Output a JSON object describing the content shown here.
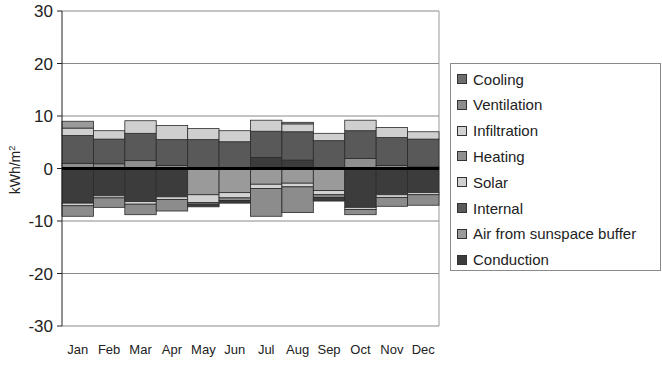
{
  "chart_data": {
    "type": "bar",
    "stacked": true,
    "diverging": true,
    "title": "",
    "xlabel": "",
    "ylabel": "kWh/m²",
    "ylim": [
      -30,
      30
    ],
    "yticks": [
      30,
      20,
      10,
      0,
      -10,
      -20,
      -30
    ],
    "grid": true,
    "legend_position": "right",
    "categories": [
      "Jan",
      "Feb",
      "Mar",
      "Apr",
      "May",
      "Jun",
      "Jul",
      "Aug",
      "Sep",
      "Oct",
      "Nov",
      "Dec"
    ],
    "series": [
      {
        "name": "Cooling",
        "color": "#6e6e6e",
        "values": [
          0,
          0,
          0,
          0,
          0,
          0,
          -4.0,
          -3.8,
          0,
          0,
          0,
          0
        ]
      },
      {
        "name": "Ventilation",
        "color": "#8c8c8c",
        "values": [
          -1.8,
          -1.6,
          -1.6,
          -1.6,
          -0.4,
          -0.5,
          -1.6,
          -1.6,
          -0.4,
          -1.0,
          -1.4,
          -1.5
        ]
      },
      {
        "name": "Infiltration",
        "color": "#d2d2d2",
        "values": [
          -0.5,
          -0.4,
          -0.5,
          -0.5,
          -1.5,
          -1.0,
          -0.8,
          -0.7,
          -0.8,
          -0.4,
          -0.5,
          -0.4
        ]
      },
      {
        "name": "Heating",
        "color": "#8f8f8f",
        "values": [
          1.0,
          0.9,
          1.3,
          0.6,
          0,
          0,
          0,
          0,
          0,
          1.7,
          0.6,
          0.3
        ]
      },
      {
        "name": "Solar",
        "color": "#cfcfcf",
        "values": [
          1.3,
          1.6,
          2.4,
          2.7,
          2.1,
          2.0,
          2.0,
          1.6,
          1.4,
          2.0,
          1.7,
          1.3
        ]
      },
      {
        "name": "Internal",
        "color": "#595959",
        "values": [
          5.3,
          4.6,
          5.3,
          4.8,
          5.5,
          5.1,
          5.0,
          5.4,
          5.2,
          5.0,
          5.0,
          5.3
        ]
      },
      {
        "name": "Air from sunspace buffer",
        "color": "#9a9a9a",
        "values": [
          0.6,
          0,
          0,
          0,
          -5.0,
          -4.0,
          -2.8,
          -2.6,
          -4.3,
          0,
          0,
          0
        ]
      },
      {
        "name": "Conduction",
        "color": "#3c3c3c",
        "values": [
          -6.8,
          -5.3,
          -6.4,
          -5.6,
          -0.7,
          -0.9,
          2.0,
          1.6,
          -0.3,
          -7.4,
          -5.2,
          -4.7
        ]
      }
    ],
    "stacks": [
      {
        "month": "Jan",
        "pos": [
          [
            "Heating",
            1.0
          ],
          [
            "Internal",
            5.3
          ],
          [
            "Solar",
            1.4
          ],
          [
            "Air from sunspace buffer",
            1.3
          ]
        ],
        "neg": [
          [
            "Conduction",
            6.6
          ],
          [
            "Infiltration",
            0.5
          ],
          [
            "Ventilation",
            2.0
          ]
        ]
      },
      {
        "month": "Feb",
        "pos": [
          [
            "Heating",
            0.9
          ],
          [
            "Internal",
            4.7
          ],
          [
            "Solar",
            1.6
          ]
        ],
        "neg": [
          [
            "Conduction",
            5.2
          ],
          [
            "Infiltration",
            0.4
          ],
          [
            "Ventilation",
            1.8
          ]
        ]
      },
      {
        "month": "Mar",
        "pos": [
          [
            "Heating",
            1.5
          ],
          [
            "Internal",
            5.2
          ],
          [
            "Solar",
            2.4
          ]
        ],
        "neg": [
          [
            "Conduction",
            6.3
          ],
          [
            "Infiltration",
            0.5
          ],
          [
            "Ventilation",
            2.0
          ]
        ]
      },
      {
        "month": "Apr",
        "pos": [
          [
            "Heating",
            0.6
          ],
          [
            "Internal",
            4.9
          ],
          [
            "Solar",
            2.7
          ]
        ],
        "neg": [
          [
            "Conduction",
            5.4
          ],
          [
            "Infiltration",
            0.5
          ],
          [
            "Ventilation",
            2.2
          ]
        ]
      },
      {
        "month": "May",
        "pos": [
          [
            "Heating",
            0.2
          ],
          [
            "Internal",
            5.3
          ],
          [
            "Solar",
            2.1
          ]
        ],
        "neg": [
          [
            "Air from sunspace buffer",
            5.0
          ],
          [
            "Infiltration",
            1.5
          ],
          [
            "Ventilation",
            0.3
          ],
          [
            "Conduction",
            0.5
          ]
        ]
      },
      {
        "month": "Jun",
        "pos": [
          [
            "Heating",
            0.1
          ],
          [
            "Internal",
            5.0
          ],
          [
            "Solar",
            2.1
          ]
        ],
        "neg": [
          [
            "Air from sunspace buffer",
            4.6
          ],
          [
            "Infiltration",
            1.0
          ],
          [
            "Ventilation",
            0.5
          ],
          [
            "Conduction",
            0.5
          ]
        ]
      },
      {
        "month": "Jul",
        "pos": [
          [
            "Conduction",
            2.1
          ],
          [
            "Internal",
            5.0
          ],
          [
            "Solar",
            2.1
          ]
        ],
        "neg": [
          [
            "Air from sunspace buffer",
            3.0
          ],
          [
            "Infiltration",
            0.8
          ],
          [
            "Ventilation",
            5.3
          ]
        ]
      },
      {
        "month": "Aug",
        "pos": [
          [
            "Conduction",
            1.6
          ],
          [
            "Internal",
            5.4
          ],
          [
            "Solar",
            1.5
          ],
          [
            "Air from sunspace buffer",
            0.3
          ]
        ],
        "neg": [
          [
            "Air from sunspace buffer",
            2.8
          ],
          [
            "Infiltration",
            0.7
          ],
          [
            "Ventilation",
            4.9
          ]
        ]
      },
      {
        "month": "Sep",
        "pos": [
          [
            "Heating",
            0.1
          ],
          [
            "Internal",
            5.2
          ],
          [
            "Solar",
            1.4
          ]
        ],
        "neg": [
          [
            "Air from sunspace buffer",
            4.2
          ],
          [
            "Infiltration",
            0.8
          ],
          [
            "Ventilation",
            0.5
          ],
          [
            "Conduction",
            0.7
          ]
        ]
      },
      {
        "month": "Oct",
        "pos": [
          [
            "Heating",
            1.9
          ],
          [
            "Internal",
            5.3
          ],
          [
            "Solar",
            2.0
          ]
        ],
        "neg": [
          [
            "Conduction",
            7.4
          ],
          [
            "Infiltration",
            0.4
          ],
          [
            "Ventilation",
            1.0
          ]
        ]
      },
      {
        "month": "Nov",
        "pos": [
          [
            "Heating",
            0.6
          ],
          [
            "Internal",
            5.3
          ],
          [
            "Solar",
            1.9
          ]
        ],
        "neg": [
          [
            "Conduction",
            5.0
          ],
          [
            "Infiltration",
            0.5
          ],
          [
            "Ventilation",
            1.7
          ]
        ]
      },
      {
        "month": "Dec",
        "pos": [
          [
            "Heating",
            0.3
          ],
          [
            "Internal",
            5.3
          ],
          [
            "Solar",
            1.4
          ]
        ],
        "neg": [
          [
            "Conduction",
            4.6
          ],
          [
            "Infiltration",
            0.4
          ],
          [
            "Ventilation",
            2.0
          ]
        ]
      }
    ]
  },
  "legend": {
    "items": [
      {
        "label": "Cooling",
        "color": "#6e6e6e"
      },
      {
        "label": "Ventilation",
        "color": "#8c8c8c"
      },
      {
        "label": "Infiltration",
        "color": "#d2d2d2"
      },
      {
        "label": "Heating",
        "color": "#8f8f8f"
      },
      {
        "label": "Solar",
        "color": "#cfcfcf"
      },
      {
        "label": "Internal",
        "color": "#595959"
      },
      {
        "label": "Air from sunspace buffer",
        "color": "#9a9a9a"
      },
      {
        "label": "Conduction",
        "color": "#3c3c3c"
      }
    ]
  },
  "axis": {
    "ylabel": "kWh/m",
    "ylabel_sup": "2"
  }
}
